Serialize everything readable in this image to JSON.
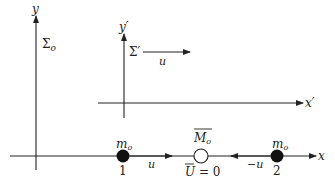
{
  "diagram": {
    "title": "",
    "frames": [
      {
        "name": "Σo",
        "axes": {
          "x": "x",
          "y": "y"
        }
      },
      {
        "name": "Σ'",
        "axes": {
          "x": "x'",
          "y": "y'"
        },
        "velocity_label": "u"
      }
    ],
    "labels": {
      "y_axis": "y",
      "sigma_o": "Σ",
      "sigma_o_sub": "o",
      "y_prime_axis": "y′",
      "sigma_prime": "Σ′",
      "frame_velocity": "u",
      "x_prime_axis": "x′",
      "x_axis": "x",
      "mass1": "m",
      "mass1_sub": "o",
      "mass1_index": "1",
      "mass1_velocity": "u",
      "composite_mass": "M",
      "composite_mass_sub": "o",
      "composite_velocity": "U",
      "composite_velocity_value": " = 0",
      "mass2": "m",
      "mass2_sub": "o",
      "mass2_index": "2",
      "mass2_velocity": "−u"
    },
    "colors": {
      "ink": "#222222",
      "background": "#ffffff"
    }
  }
}
